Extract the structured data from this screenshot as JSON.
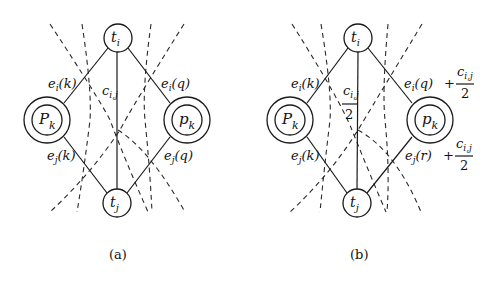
{
  "figure": {
    "panels": [
      {
        "id": "a",
        "caption": "(a)",
        "nodes": {
          "top": {
            "base": "t",
            "sub": "i"
          },
          "bottom": {
            "base": "t",
            "sub": "j"
          },
          "left": {
            "base": "P",
            "sub": "k"
          },
          "right": {
            "base": "p",
            "sub": "k"
          }
        },
        "edge_labels": {
          "upper_left": {
            "base": "e",
            "sub": "i",
            "arg": "(k)"
          },
          "lower_left": {
            "base": "e",
            "sub": "j",
            "arg": "(k)"
          },
          "upper_right": {
            "base": "e",
            "sub": "i",
            "arg": "(q)"
          },
          "lower_right": {
            "base": "e",
            "sub": "j",
            "arg": "(q)"
          },
          "center": {
            "base": "c",
            "sub": "i,j"
          }
        }
      },
      {
        "id": "b",
        "caption": "(b)",
        "nodes": {
          "top": {
            "base": "t",
            "sub": "i"
          },
          "bottom": {
            "base": "t",
            "sub": "j"
          },
          "left": {
            "base": "P",
            "sub": "k"
          },
          "right": {
            "base": "p",
            "sub": "k"
          }
        },
        "edge_labels": {
          "upper_left": {
            "base": "e",
            "sub": "i",
            "arg": "(k)"
          },
          "lower_left": {
            "base": "e",
            "sub": "j",
            "arg": "(k)"
          },
          "upper_right": {
            "base": "e",
            "sub": "i",
            "arg": "(q)",
            "plus": "+",
            "frac_num_base": "c",
            "frac_num_sub": "i,j",
            "frac_den": "2"
          },
          "lower_right": {
            "base": "e",
            "sub": "j",
            "arg": "(r)",
            "plus": "+",
            "frac_num_base": "c",
            "frac_num_sub": "i,j",
            "frac_den": "2"
          },
          "center": {
            "frac_num_base": "c",
            "frac_num_sub": "i,j",
            "frac_den": "2"
          }
        }
      }
    ]
  }
}
